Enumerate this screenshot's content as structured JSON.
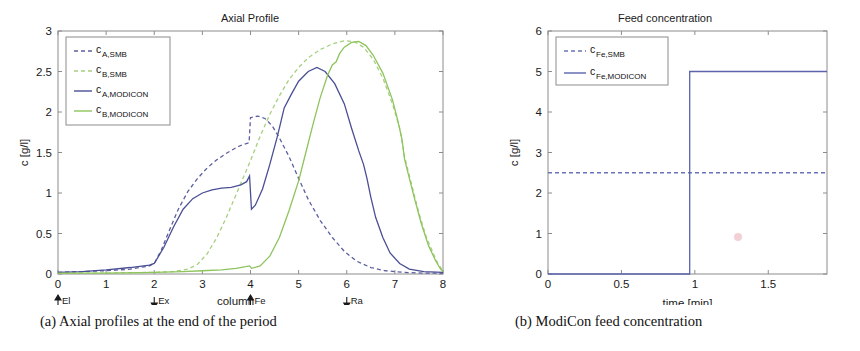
{
  "figure": {
    "caption_a": "(a) Axial profiles at the end of the period",
    "caption_b": "(b) ModiCon feed concentration"
  },
  "panel_a": {
    "title": "Axial Profile",
    "legend": [
      {
        "label": "c",
        "sub": "A,SMB",
        "color": "#5b5f9e",
        "style": "dashed"
      },
      {
        "label": "c",
        "sub": "B,SMB",
        "color": "#a6cf7f",
        "style": "dashed"
      },
      {
        "label": "c",
        "sub": "A,MODICON",
        "color": "#4a4f94",
        "style": "solid"
      },
      {
        "label": "c",
        "sub": "B,MODICON",
        "color": "#8dc45c",
        "style": "solid"
      }
    ],
    "ports": [
      {
        "name": "El",
        "x": 0,
        "dir": "up"
      },
      {
        "name": "Ex",
        "x": 2,
        "dir": "down"
      },
      {
        "name": "Fe",
        "x": 4,
        "dir": "up"
      },
      {
        "name": "Ra",
        "x": 6,
        "dir": "down"
      }
    ]
  },
  "panel_b": {
    "title": "Feed concentration",
    "legend": [
      {
        "label": "c",
        "sub": "Fe,SMB",
        "color": "#6b73b8",
        "style": "dashed"
      },
      {
        "label": "c",
        "sub": "Fe,MODICON",
        "color": "#5b63ad",
        "style": "solid"
      }
    ]
  },
  "chart_data": [
    {
      "type": "line",
      "id": "axial-profile",
      "title": "Axial Profile",
      "xlabel": "column",
      "ylabel": "c [g/l]",
      "xlim": [
        0,
        8
      ],
      "ylim": [
        0,
        3
      ],
      "xticks": [
        0,
        1,
        2,
        3,
        4,
        5,
        6,
        7,
        8
      ],
      "yticks": [
        0,
        0.5,
        1,
        1.5,
        2,
        2.5,
        3
      ],
      "grid": false,
      "legend_position": "upper-left",
      "annotations": [
        {
          "text": "El",
          "x": 0,
          "marker": "arrow-up"
        },
        {
          "text": "Ex",
          "x": 2,
          "marker": "arrow-down"
        },
        {
          "text": "Fe",
          "x": 4,
          "marker": "arrow-up"
        },
        {
          "text": "Ra",
          "x": 6,
          "marker": "arrow-down"
        }
      ],
      "series": [
        {
          "name": "c_A,SMB",
          "color": "#5b5f9e",
          "style": "dashed",
          "points": [
            [
              0.0,
              0.02
            ],
            [
              0.5,
              0.03
            ],
            [
              1.0,
              0.04
            ],
            [
              1.5,
              0.06
            ],
            [
              1.9,
              0.1
            ],
            [
              2.0,
              0.13
            ],
            [
              2.15,
              0.3
            ],
            [
              2.3,
              0.52
            ],
            [
              2.5,
              0.8
            ],
            [
              2.7,
              1.02
            ],
            [
              2.9,
              1.18
            ],
            [
              3.1,
              1.31
            ],
            [
              3.3,
              1.41
            ],
            [
              3.5,
              1.49
            ],
            [
              3.7,
              1.56
            ],
            [
              3.85,
              1.6
            ],
            [
              3.97,
              1.62
            ],
            [
              4.0,
              1.93
            ],
            [
              4.15,
              1.95
            ],
            [
              4.3,
              1.92
            ],
            [
              4.45,
              1.83
            ],
            [
              4.6,
              1.68
            ],
            [
              4.8,
              1.45
            ],
            [
              5.0,
              1.18
            ],
            [
              5.2,
              0.92
            ],
            [
              5.45,
              0.66
            ],
            [
              5.7,
              0.45
            ],
            [
              5.95,
              0.28
            ],
            [
              6.2,
              0.16
            ],
            [
              6.5,
              0.08
            ],
            [
              6.8,
              0.04
            ],
            [
              7.2,
              0.02
            ],
            [
              7.6,
              0.01
            ],
            [
              8.0,
              0.01
            ]
          ]
        },
        {
          "name": "c_B,SMB",
          "color": "#a6cf7f",
          "style": "dashed",
          "points": [
            [
              0.0,
              0.01
            ],
            [
              1.0,
              0.01
            ],
            [
              2.0,
              0.02
            ],
            [
              2.4,
              0.03
            ],
            [
              2.7,
              0.06
            ],
            [
              2.9,
              0.12
            ],
            [
              3.1,
              0.25
            ],
            [
              3.3,
              0.45
            ],
            [
              3.5,
              0.7
            ],
            [
              3.7,
              0.98
            ],
            [
              3.9,
              1.26
            ],
            [
              4.0,
              1.4
            ],
            [
              4.2,
              1.7
            ],
            [
              4.4,
              1.97
            ],
            [
              4.6,
              2.2
            ],
            [
              4.8,
              2.4
            ],
            [
              5.0,
              2.55
            ],
            [
              5.2,
              2.67
            ],
            [
              5.45,
              2.77
            ],
            [
              5.7,
              2.84
            ],
            [
              5.95,
              2.88
            ],
            [
              6.15,
              2.87
            ],
            [
              6.35,
              2.8
            ],
            [
              6.55,
              2.65
            ],
            [
              6.75,
              2.42
            ],
            [
              6.95,
              2.1
            ],
            [
              7.1,
              1.8
            ],
            [
              7.2,
              1.45
            ],
            [
              7.35,
              1.1
            ],
            [
              7.5,
              0.75
            ],
            [
              7.65,
              0.46
            ],
            [
              7.8,
              0.25
            ],
            [
              7.9,
              0.12
            ],
            [
              8.0,
              0.04
            ]
          ]
        },
        {
          "name": "c_A,MODICON",
          "color": "#4a4f94",
          "style": "solid",
          "points": [
            [
              0.0,
              0.02
            ],
            [
              0.5,
              0.03
            ],
            [
              1.0,
              0.05
            ],
            [
              1.5,
              0.08
            ],
            [
              1.9,
              0.11
            ],
            [
              2.0,
              0.13
            ],
            [
              2.2,
              0.33
            ],
            [
              2.4,
              0.58
            ],
            [
              2.6,
              0.8
            ],
            [
              2.8,
              0.93
            ],
            [
              3.0,
              1.0
            ],
            [
              3.2,
              1.04
            ],
            [
              3.4,
              1.06
            ],
            [
              3.6,
              1.07
            ],
            [
              3.8,
              1.1
            ],
            [
              3.92,
              1.14
            ],
            [
              3.98,
              1.21
            ],
            [
              4.02,
              0.8
            ],
            [
              4.1,
              0.85
            ],
            [
              4.25,
              1.05
            ],
            [
              4.4,
              1.35
            ],
            [
              4.55,
              1.68
            ],
            [
              4.62,
              1.85
            ],
            [
              4.7,
              2.05
            ],
            [
              4.85,
              2.22
            ],
            [
              5.0,
              2.38
            ],
            [
              5.2,
              2.5
            ],
            [
              5.38,
              2.55
            ],
            [
              5.55,
              2.5
            ],
            [
              5.75,
              2.35
            ],
            [
              5.95,
              2.1
            ],
            [
              6.1,
              1.8
            ],
            [
              6.25,
              1.52
            ],
            [
              6.35,
              1.35
            ],
            [
              6.42,
              1.18
            ],
            [
              6.5,
              0.95
            ],
            [
              6.6,
              0.7
            ],
            [
              6.75,
              0.45
            ],
            [
              6.9,
              0.26
            ],
            [
              7.1,
              0.13
            ],
            [
              7.3,
              0.06
            ],
            [
              7.6,
              0.03
            ],
            [
              8.0,
              0.02
            ]
          ]
        },
        {
          "name": "c_B,MODICON",
          "color": "#8dc45c",
          "style": "solid",
          "points": [
            [
              0.0,
              0.01
            ],
            [
              1.0,
              0.01
            ],
            [
              2.0,
              0.02
            ],
            [
              2.6,
              0.03
            ],
            [
              3.0,
              0.04
            ],
            [
              3.4,
              0.05
            ],
            [
              3.7,
              0.07
            ],
            [
              3.9,
              0.09
            ],
            [
              3.98,
              0.1
            ],
            [
              4.02,
              0.07
            ],
            [
              4.2,
              0.1
            ],
            [
              4.4,
              0.22
            ],
            [
              4.6,
              0.45
            ],
            [
              4.8,
              0.78
            ],
            [
              5.0,
              1.15
            ],
            [
              5.15,
              1.5
            ],
            [
              5.3,
              1.85
            ],
            [
              5.45,
              2.18
            ],
            [
              5.6,
              2.45
            ],
            [
              5.7,
              2.58
            ],
            [
              5.78,
              2.62
            ],
            [
              5.85,
              2.72
            ],
            [
              5.95,
              2.8
            ],
            [
              6.1,
              2.86
            ],
            [
              6.25,
              2.87
            ],
            [
              6.4,
              2.82
            ],
            [
              6.55,
              2.7
            ],
            [
              6.75,
              2.48
            ],
            [
              6.95,
              2.15
            ],
            [
              7.05,
              1.92
            ],
            [
              7.15,
              1.66
            ],
            [
              7.2,
              1.42
            ],
            [
              7.25,
              1.3
            ],
            [
              7.4,
              0.95
            ],
            [
              7.55,
              0.62
            ],
            [
              7.7,
              0.35
            ],
            [
              7.85,
              0.16
            ],
            [
              7.95,
              0.06
            ],
            [
              8.0,
              0.03
            ]
          ]
        }
      ]
    },
    {
      "type": "line",
      "id": "feed-concentration",
      "title": "Feed concentration",
      "xlabel": "time [min]",
      "ylabel": "c [g/l]",
      "xlim": [
        0,
        1.9
      ],
      "ylim": [
        0,
        6
      ],
      "xticks": [
        0,
        0.5,
        1,
        1.5
      ],
      "yticks": [
        0,
        1,
        2,
        3,
        4,
        5,
        6
      ],
      "grid": false,
      "legend_position": "upper-left",
      "series": [
        {
          "name": "c_Fe,SMB",
          "color": "#6b73b8",
          "style": "dashed",
          "points": [
            [
              0.0,
              2.5
            ],
            [
              1.9,
              2.5
            ]
          ]
        },
        {
          "name": "c_Fe,MODICON",
          "color": "#5b63ad",
          "style": "solid",
          "points": [
            [
              0.0,
              0.0
            ],
            [
              0.965,
              0.0
            ],
            [
              0.965,
              5.0
            ],
            [
              1.9,
              5.0
            ]
          ]
        }
      ]
    }
  ]
}
